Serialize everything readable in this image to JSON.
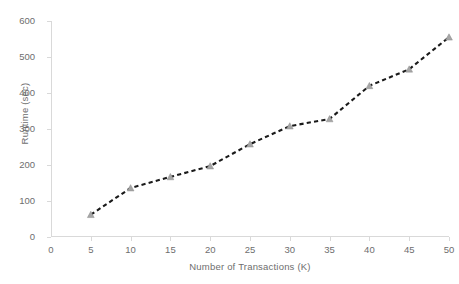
{
  "chart_data": {
    "type": "line",
    "title": "",
    "xlabel": "Number of Transactions (K)",
    "ylabel": "Runtime (sec)",
    "x": [
      5,
      10,
      15,
      20,
      25,
      30,
      35,
      40,
      45,
      50
    ],
    "values": [
      62,
      136,
      167,
      197,
      258,
      308,
      328,
      420,
      466,
      555
    ],
    "series": [
      {
        "name": "Runtime",
        "values": [
          62,
          136,
          167,
          197,
          258,
          308,
          328,
          420,
          466,
          555
        ]
      }
    ],
    "xlim": [
      0,
      50
    ],
    "ylim": [
      0,
      600
    ],
    "x_ticks": [
      "0",
      "5",
      "10",
      "15",
      "20",
      "25",
      "30",
      "35",
      "40",
      "45",
      "50"
    ],
    "x_tick_values": [
      0,
      5,
      10,
      15,
      20,
      25,
      30,
      35,
      40,
      45,
      50
    ],
    "y_ticks": [
      "0",
      "100",
      "200",
      "300",
      "400",
      "500",
      "600"
    ],
    "y_tick_values": [
      0,
      100,
      200,
      300,
      400,
      500,
      600
    ],
    "grid": false,
    "legend": "none",
    "line_style": "dashed",
    "line_color": "#1a1a1a",
    "marker_style": "triangle",
    "marker_color": "#a6a6a6",
    "axis_color": "#d9d9d9",
    "text_color": "#6e6e6e",
    "background_color": "#ffffff"
  }
}
